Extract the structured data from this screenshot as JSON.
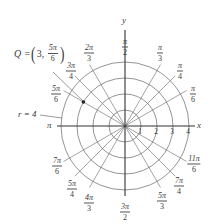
{
  "diagram": {
    "center_px": [
      125,
      126
    ],
    "ring_spacing_px": 16,
    "rings": [
      1,
      2,
      3,
      4
    ],
    "axis_labels": {
      "x": "x",
      "y": "y"
    },
    "radial_tick_labels": [
      "1",
      "2",
      "3",
      "4"
    ],
    "angle_labels": [
      {
        "angle_deg": 90,
        "num": "π",
        "den": "2",
        "pos": [
          125,
          47
        ]
      },
      {
        "angle_deg": 60,
        "num": "π",
        "den": "3",
        "pos": [
          160,
          53
        ]
      },
      {
        "angle_deg": 45,
        "num": "π",
        "den": "4",
        "pos": [
          180,
          71
        ]
      },
      {
        "angle_deg": 30,
        "num": "π",
        "den": "6",
        "pos": [
          193,
          94
        ]
      },
      {
        "angle_deg": 120,
        "num": "2π",
        "den": "3",
        "pos": [
          89,
          53
        ]
      },
      {
        "angle_deg": 135,
        "num": "3π",
        "den": "4",
        "pos": [
          71,
          71
        ]
      },
      {
        "angle_deg": 150,
        "num": "5π",
        "den": "6",
        "pos": [
          56,
          94
        ]
      },
      {
        "angle_deg": 210,
        "num": "7π",
        "den": "6",
        "pos": [
          57,
          166
        ]
      },
      {
        "angle_deg": 225,
        "num": "5π",
        "den": "4",
        "pos": [
          72,
          189
        ]
      },
      {
        "angle_deg": 240,
        "num": "4π",
        "den": "3",
        "pos": [
          89,
          203
        ]
      },
      {
        "angle_deg": 270,
        "num": "3π",
        "den": "2",
        "pos": [
          125,
          212
        ]
      },
      {
        "angle_deg": 300,
        "num": "5π",
        "den": "3",
        "pos": [
          162,
          201
        ]
      },
      {
        "angle_deg": 315,
        "num": "7π",
        "den": "4",
        "pos": [
          179,
          186
        ]
      },
      {
        "angle_deg": 330,
        "num": "11π",
        "den": "6",
        "pos": [
          194,
          164
        ]
      }
    ],
    "pi_label": "π",
    "point_Q": {
      "label_prefix": "Q = ",
      "r": "3",
      "theta_num": "5π",
      "theta_den": "6",
      "r_value": 3,
      "theta_deg": 150
    },
    "circle_annotation": "r = 4",
    "colors": {
      "line": "#555555",
      "axis": "#333333",
      "text": "#3a3a3a",
      "point": "#222222"
    }
  }
}
